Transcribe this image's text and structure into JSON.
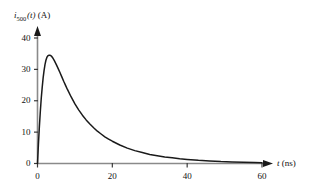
{
  "chart_data": {
    "type": "line",
    "title": "",
    "subtitle": "",
    "xlabel": "t (ns)",
    "xlabel_symbol": "t",
    "xlabel_unit": "(ns)",
    "ylabel": "i_500(t) (A)",
    "ylabel_symbol": "i",
    "ylabel_subscript": "500",
    "ylabel_arg": "(t)",
    "ylabel_unit": "(A)",
    "xlim": [
      0,
      60
    ],
    "ylim": [
      0,
      44
    ],
    "xticks": [
      0,
      20,
      40,
      60
    ],
    "xtick_labels": [
      "0",
      "20",
      "40",
      "60"
    ],
    "yticks": [
      0,
      10,
      20,
      30,
      40
    ],
    "ytick_labels": [
      "0",
      "10",
      "20",
      "30",
      "40"
    ],
    "grid": false,
    "legend": false,
    "legend_position": "none",
    "line_color": "#1a1a1a",
    "axis_color": "#808080",
    "arrow_color": "#1a1a1a",
    "background_color": "#ffffff",
    "peak_value": 34,
    "peak_time": 3.5,
    "series": [
      {
        "name": "i_500(t)",
        "x": [
          0,
          0.25,
          0.5,
          0.75,
          1,
          1.25,
          1.5,
          1.75,
          2,
          2.25,
          2.5,
          2.75,
          3,
          3.25,
          3.5,
          3.75,
          4,
          4.5,
          5,
          5.5,
          6,
          6.5,
          7,
          7.5,
          8,
          9,
          10,
          11,
          12,
          13,
          14,
          15,
          16,
          17,
          18,
          19,
          20,
          22,
          24,
          26,
          28,
          30,
          32,
          34,
          36,
          38,
          40,
          43,
          46,
          49,
          52,
          55,
          58,
          60
        ],
        "values": [
          0,
          6.2,
          11.7,
          16.5,
          20.7,
          24.2,
          27.2,
          29.6,
          31.5,
          32.9,
          33.8,
          34.3,
          34.5,
          34.5,
          34.4,
          34.2,
          33.8,
          32.8,
          31.6,
          30.3,
          29,
          27.6,
          26.2,
          24.9,
          23.6,
          21.2,
          19,
          17.1,
          15.4,
          13.9,
          12.6,
          11.4,
          10.3,
          9.4,
          8.5,
          7.8,
          7.1,
          5.9,
          4.9,
          4.1,
          3.5,
          2.9,
          2.5,
          2.1,
          1.8,
          1.5,
          1.3,
          1,
          0.8,
          0.6,
          0.5,
          0.4,
          0.3,
          0.25
        ]
      }
    ]
  }
}
